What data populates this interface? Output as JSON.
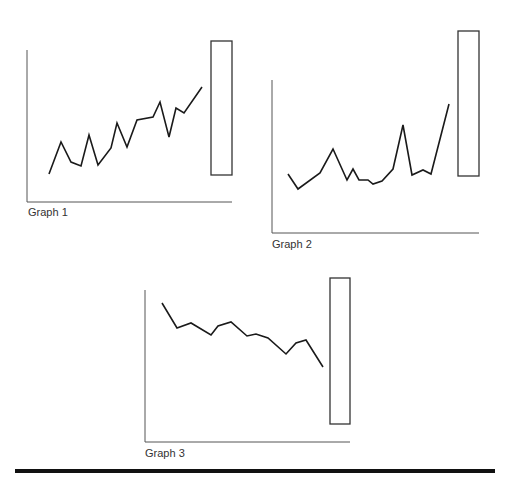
{
  "graphs": [
    {
      "label": "Graph 1",
      "axis": {
        "x": 27,
        "top": 50,
        "bottom": 202,
        "right": 232
      },
      "points": [
        [
          49,
          174
        ],
        [
          61,
          142
        ],
        [
          71,
          162
        ],
        [
          81,
          166
        ],
        [
          89,
          135
        ],
        [
          98,
          165
        ],
        [
          111,
          148
        ],
        [
          117,
          123
        ],
        [
          127,
          147
        ],
        [
          137,
          120
        ],
        [
          153,
          117
        ],
        [
          160,
          102
        ],
        [
          169,
          137
        ],
        [
          176,
          108
        ],
        [
          184,
          113
        ],
        [
          202,
          87
        ]
      ],
      "rect": {
        "x": 211,
        "y": 41,
        "w": 21,
        "h": 134
      },
      "label_pos": {
        "x": 28,
        "y": 206
      }
    },
    {
      "label": "Graph 2",
      "axis": {
        "x": 272,
        "top": 80,
        "bottom": 233,
        "right": 479
      },
      "points": [
        [
          288,
          174
        ],
        [
          298,
          189
        ],
        [
          320,
          173
        ],
        [
          333,
          149
        ],
        [
          347,
          180
        ],
        [
          353,
          169
        ],
        [
          359,
          180
        ],
        [
          368,
          180
        ],
        [
          373,
          184
        ],
        [
          382,
          181
        ],
        [
          393,
          169
        ],
        [
          403,
          125
        ],
        [
          412,
          175
        ],
        [
          423,
          170
        ],
        [
          431,
          174
        ],
        [
          449,
          104
        ]
      ],
      "rect": {
        "x": 458,
        "y": 31,
        "w": 21,
        "h": 145
      },
      "label_pos": {
        "x": 272,
        "y": 238
      }
    },
    {
      "label": "Graph 3",
      "axis": {
        "x": 145,
        "top": 290,
        "bottom": 442,
        "right": 350
      },
      "points": [
        [
          162,
          303
        ],
        [
          177,
          328
        ],
        [
          191,
          323
        ],
        [
          211,
          335
        ],
        [
          218,
          326
        ],
        [
          231,
          322
        ],
        [
          247,
          336
        ],
        [
          256,
          334
        ],
        [
          268,
          338
        ],
        [
          286,
          354
        ],
        [
          296,
          343
        ],
        [
          306,
          340
        ],
        [
          323,
          367
        ]
      ],
      "rect": {
        "x": 330,
        "y": 278,
        "w": 20,
        "h": 146
      },
      "label_pos": {
        "x": 145,
        "y": 447
      }
    }
  ],
  "colors": {
    "line": "#1a1a1a",
    "axis": "#555555",
    "rect": "#333333",
    "rule": "#111111"
  }
}
